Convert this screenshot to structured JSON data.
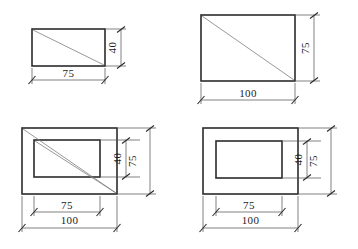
{
  "drawing": {
    "title": "Rectangular plate dimension study",
    "units_note": "",
    "line_color": "#2b2b2b",
    "diagonal_color": "#7d7d7d",
    "dimension_color": "#4a4a4a",
    "background": "#ffffff",
    "figures": [
      {
        "id": "fig-top-left",
        "name": "plain-plate-75x40",
        "has_inner_rect": false,
        "has_diagonal": true,
        "outer": {
          "width_label": "75",
          "height_label": "40"
        },
        "inner": null,
        "dimensions": {
          "horizontal": [
            {
              "label": "75",
              "level": "outer"
            }
          ],
          "vertical": [
            {
              "label": "40",
              "level": "outer"
            }
          ]
        }
      },
      {
        "id": "fig-top-right",
        "name": "plain-plate-100x75",
        "has_inner_rect": false,
        "has_diagonal": true,
        "outer": {
          "width_label": "100",
          "height_label": "75"
        },
        "inner": null,
        "dimensions": {
          "horizontal": [
            {
              "label": "100",
              "level": "outer"
            }
          ],
          "vertical": [
            {
              "label": "75",
              "level": "outer"
            }
          ]
        }
      },
      {
        "id": "fig-bottom-left",
        "name": "framed-plate-with-diagonals",
        "has_inner_rect": true,
        "has_diagonal": true,
        "outer": {
          "width_label": "100",
          "height_label": "75"
        },
        "inner": {
          "width_label": "75",
          "height_label": "40"
        },
        "dimensions": {
          "horizontal": [
            {
              "label": "75",
              "level": "inner"
            },
            {
              "label": "100",
              "level": "outer"
            }
          ],
          "vertical": [
            {
              "label": "40",
              "level": "inner"
            },
            {
              "label": "75",
              "level": "outer"
            }
          ]
        }
      },
      {
        "id": "fig-bottom-right",
        "name": "framed-plate-plain",
        "has_inner_rect": true,
        "has_diagonal": false,
        "outer": {
          "width_label": "100",
          "height_label": "75"
        },
        "inner": {
          "width_label": "75",
          "height_label": "40"
        },
        "dimensions": {
          "horizontal": [
            {
              "label": "75",
              "level": "inner"
            },
            {
              "label": "100",
              "level": "outer"
            }
          ],
          "vertical": [
            {
              "label": "40",
              "level": "inner"
            },
            {
              "label": "75",
              "level": "outer"
            }
          ]
        }
      }
    ],
    "labels": {
      "tl_width": "75",
      "tl_height": "40",
      "tr_width": "100",
      "tr_height": "75",
      "bl_width_inner": "75",
      "bl_width_outer": "100",
      "bl_height_inner": "40",
      "bl_height_outer": "75",
      "br_width_inner": "75",
      "br_width_outer": "100",
      "br_height_inner": "40",
      "br_height_outer": "75"
    }
  }
}
